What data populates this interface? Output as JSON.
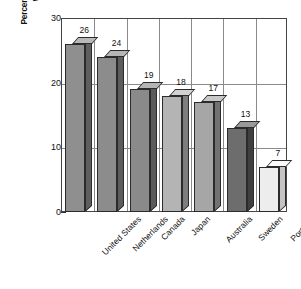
{
  "chart_data": {
    "type": "bar",
    "title": "",
    "subtitle": "",
    "xlabel": "",
    "ylabel": "Percentage of People, Ages 25 to 64, with a University Degree",
    "ylabel_line1": "Percentage of People, Ages 25 to 64,",
    "ylabel_line2": "with a University Degree",
    "categories": [
      "United States",
      "Netherlands",
      "Canada",
      "Japan",
      "Australia",
      "Sweden",
      "Portugal"
    ],
    "values": [
      26,
      24,
      19,
      18,
      17,
      13,
      7
    ],
    "value_labels": [
      "26",
      "24",
      "19",
      "18",
      "17",
      "13",
      "7"
    ],
    "ylim": [
      0,
      30
    ],
    "yticks": [
      0,
      10,
      20,
      30
    ],
    "ytick_labels": [
      "0",
      "10",
      "20",
      "30"
    ],
    "grid": true,
    "grid_axis": "both",
    "legend": false,
    "legend_position": "none",
    "style": "3d-bar",
    "bar_colors": [
      "#8f8f8f",
      "#8c8c8c",
      "#8a8a8a",
      "#b4b4b4",
      "#a6a6a6",
      "#6d6d6d",
      "#ededed"
    ],
    "bar_top_colors": [
      "#b8b8b8",
      "#b6b6b6",
      "#b4b4b4",
      "#d2d2d2",
      "#c8c8c8",
      "#9a9a9a",
      "#fafafa"
    ],
    "bar_side_colors": [
      "#5e5e5e",
      "#5c5c5c",
      "#5a5a5a",
      "#7e7e7e",
      "#727272",
      "#3f3f3f",
      "#c4c4c4"
    ],
    "axis_color": "#444444",
    "grid_color": "#8a8a8a",
    "text_color": "#101010",
    "background_color": "#ffffff"
  }
}
